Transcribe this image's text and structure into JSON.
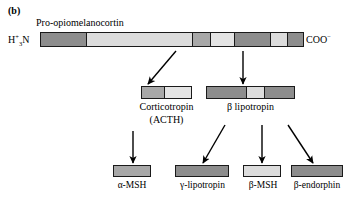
{
  "figure": {
    "panel_letter": "(b)",
    "precursor_name": "Pro-opiomelanocortin",
    "n_terminus": {
      "base": "H",
      "sup": "+",
      "sub": "3",
      "tail": "N"
    },
    "c_terminus": {
      "base": "COO",
      "sup": "−"
    }
  },
  "colors": {
    "dark_gray": "#8d8d8d",
    "mid_gray": "#a8a8a8",
    "light_gray": "#c7c7c7",
    "pale_gray": "#dcdcdc",
    "very_pale": "#e4e4e4",
    "outline": "#1a1a1a",
    "background": "#ffffff",
    "arrow": "#000000"
  },
  "precursor_bar": {
    "name": "pro-opiomelanocortin-bar",
    "segments": [
      {
        "name": "signal-peptide",
        "width_pct": 17.0,
        "color": "#8d8d8d"
      },
      {
        "name": "pro-region",
        "width_pct": 40.5,
        "color": "#dcdcdc"
      },
      {
        "name": "alpha-msh-region",
        "width_pct": 7.0,
        "color": "#a8a8a8"
      },
      {
        "name": "acth-clip-region",
        "width_pct": 9.0,
        "color": "#e4e4e4"
      },
      {
        "name": "gamma-lipotropin-region",
        "width_pct": 14.0,
        "color": "#8d8d8d"
      },
      {
        "name": "beta-msh-region",
        "width_pct": 6.5,
        "color": "#dcdcdc"
      },
      {
        "name": "beta-endorphin-region",
        "width_pct": 6.0,
        "color": "#8d8d8d"
      }
    ]
  },
  "intermediates": [
    {
      "id": "corticotropin",
      "bar_name": "corticotropin-bar",
      "label_line1": "Corticotropin",
      "label_line2": "(ACTH)",
      "segments": [
        {
          "name": "alpha-msh-region",
          "width_pct": 45,
          "color": "#a8a8a8"
        },
        {
          "name": "clip-region",
          "width_pct": 55,
          "color": "#e4e4e4"
        }
      ]
    },
    {
      "id": "beta-lipotropin",
      "bar_name": "beta-lipotropin-bar",
      "label_line1": "β lipotropin",
      "label_line2": "",
      "segments": [
        {
          "name": "gamma-lipotropin-region",
          "width_pct": 45,
          "color": "#8d8d8d"
        },
        {
          "name": "beta-msh-region",
          "width_pct": 20,
          "color": "#dcdcdc"
        },
        {
          "name": "beta-endorphin-region",
          "width_pct": 35,
          "color": "#8d8d8d"
        }
      ]
    }
  ],
  "products": [
    {
      "id": "alpha-msh",
      "bar_name": "alpha-msh-bar",
      "label": "α-MSH",
      "color": "#a8a8a8"
    },
    {
      "id": "gamma-lipotropin",
      "bar_name": "gamma-lipotropin-bar",
      "label": "γ-lipotropin",
      "color": "#8d8d8d"
    },
    {
      "id": "beta-msh",
      "bar_name": "beta-msh-bar",
      "label": "β-MSH",
      "color": "#dcdcdc"
    },
    {
      "id": "beta-endorphin",
      "bar_name": "beta-endorphin-bar",
      "label": "β-endorphin",
      "color": "#8d8d8d"
    }
  ],
  "arrows": [
    {
      "name": "arrow-pomc-to-corticotropin",
      "x1": 176,
      "y1": 51,
      "x2": 148,
      "y2": 84
    },
    {
      "name": "arrow-pomc-to-beta-lipotropin",
      "x1": 243,
      "y1": 51,
      "x2": 243,
      "y2": 84
    },
    {
      "name": "arrow-corticotropin-to-alpha-msh",
      "x1": 133,
      "y1": 131,
      "x2": 133,
      "y2": 163
    },
    {
      "name": "arrow-beta-lipotropin-to-gamma-lipotropin",
      "x1": 225,
      "y1": 125,
      "x2": 203,
      "y2": 163
    },
    {
      "name": "arrow-beta-lipotropin-to-beta-msh",
      "x1": 262,
      "y1": 125,
      "x2": 262,
      "y2": 163
    },
    {
      "name": "arrow-beta-lipotropin-to-beta-endorphin",
      "x1": 288,
      "y1": 125,
      "x2": 313,
      "y2": 163
    }
  ]
}
